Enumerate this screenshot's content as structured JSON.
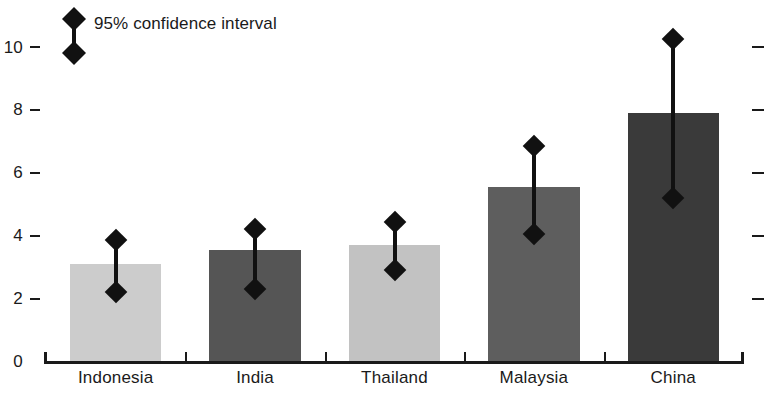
{
  "chart_data": {
    "type": "bar",
    "title": "",
    "subtitle": "",
    "xlabel": "",
    "ylabel": "",
    "ylim": [
      0,
      11
    ],
    "grid": false,
    "categories": [
      "Indonesia",
      "India",
      "Thailand",
      "Malaysia",
      "China"
    ],
    "yticks": [
      0,
      2,
      4,
      6,
      8,
      10
    ],
    "ytick_labels": [
      "0",
      "2",
      "4",
      "6",
      "8",
      "10"
    ],
    "right_axis_ticks": [
      2,
      4,
      6,
      8,
      10
    ],
    "series": [
      {
        "name": "estimate",
        "values": [
          3.1,
          3.55,
          3.7,
          5.55,
          7.9
        ]
      }
    ],
    "error_bars": {
      "label": "95% confidence interval",
      "lower": [
        2.2,
        2.3,
        2.9,
        4.05,
        5.2
      ],
      "upper": [
        3.85,
        4.2,
        4.45,
        6.85,
        10.25
      ]
    },
    "bar_colors": [
      "#cccccc",
      "#555555",
      "#c2c2c2",
      "#5e5e5e",
      "#3a3a3a"
    ],
    "marker_color": "#111111",
    "axis_color": "#1a1a1a",
    "legend": {
      "position": "top-left",
      "entries": [
        "95% confidence interval"
      ]
    },
    "annotations": []
  },
  "legend": {
    "ci_label": "95% confidence interval"
  }
}
